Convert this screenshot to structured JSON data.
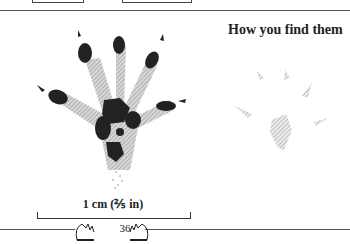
{
  "page": {
    "heading": "How you find them",
    "scale_label": "1 cm (⅖ in)",
    "page_number": "36"
  },
  "illustrations": {
    "main": "frog-foot-print-detailed",
    "secondary": "frog-foot-print-as-found"
  }
}
